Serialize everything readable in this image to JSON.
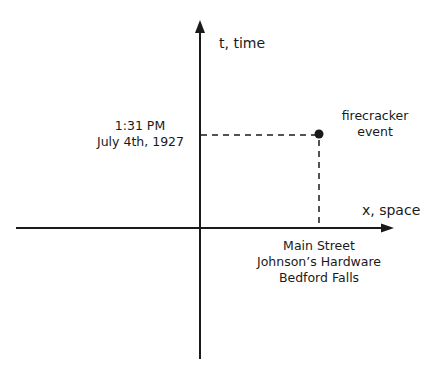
{
  "diagram": {
    "type": "spacetime-diagram",
    "axes": {
      "t_axis_label": "t, time",
      "x_axis_label": "x, space"
    },
    "event": {
      "label_line1": "firecracker",
      "label_line2": "event",
      "time_line1": "1:31  PM",
      "time_line2": "July 4th, 1927",
      "place_line1": "Main Street",
      "place_line2": "Johnson’s  Hardware",
      "place_line3": "Bedford Falls"
    },
    "colors": {
      "ink": "#1a1a1a",
      "background": "#ffffff"
    }
  }
}
